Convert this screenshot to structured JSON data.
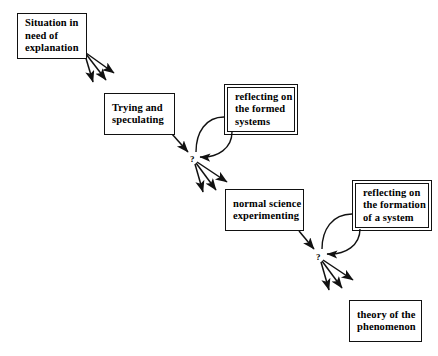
{
  "diagram": {
    "background_color": "#ffffff",
    "stroke_color": "#111111",
    "nodes": [
      {
        "id": "situation",
        "name": "situation-node",
        "style": "single",
        "lines": [
          "Situation in",
          "need of",
          "explanation"
        ],
        "x": 17,
        "y": 13,
        "w": 70,
        "h": 46
      },
      {
        "id": "trying",
        "name": "trying-node",
        "style": "single",
        "lines": [
          "Trying and",
          "speculating"
        ],
        "x": 104,
        "y": 93,
        "w": 71,
        "h": 42
      },
      {
        "id": "reflecting-formed",
        "name": "reflecting-formed-systems-node",
        "style": "double",
        "lines": [
          "reflecting on",
          "the formed",
          "systems"
        ],
        "x": 227,
        "y": 87,
        "w": 68,
        "h": 45
      },
      {
        "id": "normal-science",
        "name": "normal-science-node",
        "style": "single",
        "lines": [
          "normal science",
          "experimenting"
        ],
        "x": 225,
        "y": 189,
        "w": 79,
        "h": 42
      },
      {
        "id": "reflecting-formation",
        "name": "reflecting-formation-node",
        "style": "double",
        "lines": [
          "reflecting on",
          "the formation",
          "of a system"
        ],
        "x": 355,
        "y": 183,
        "w": 74,
        "h": 45
      },
      {
        "id": "theory",
        "name": "theory-node",
        "style": "single",
        "lines": [
          "theory of the",
          "phenomenon"
        ],
        "x": 349,
        "y": 300,
        "w": 73,
        "h": 42
      }
    ],
    "junctions": [
      {
        "id": "q1",
        "name": "question-mark-1",
        "label": "?",
        "x": 190,
        "y": 155
      },
      {
        "id": "q2",
        "name": "question-mark-2",
        "label": "?",
        "x": 316,
        "y": 253
      }
    ],
    "connectors": [
      {
        "name": "situation-to-trying-fan",
        "type": "arrow-fan",
        "count": 3,
        "from": "situation",
        "to": "trying"
      },
      {
        "name": "trying-to-junction-1",
        "type": "arrow",
        "from": "trying",
        "to": "q1"
      },
      {
        "name": "junction-1-reflecting-loop",
        "type": "loop",
        "from": "q1",
        "to": "reflecting-formed"
      },
      {
        "name": "junction-1-to-normal-science-fan",
        "type": "arrow-fan",
        "count": 3,
        "from": "q1",
        "to": "normal-science"
      },
      {
        "name": "normal-science-to-junction-2",
        "type": "arrow",
        "from": "normal-science",
        "to": "q2"
      },
      {
        "name": "junction-2-reflecting-loop",
        "type": "loop",
        "from": "q2",
        "to": "reflecting-formation"
      },
      {
        "name": "junction-2-to-theory-fan",
        "type": "arrow-fan",
        "count": 3,
        "from": "q2",
        "to": "theory"
      }
    ]
  }
}
